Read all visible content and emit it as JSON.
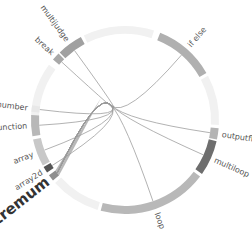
{
  "diagram": {
    "type": "chord",
    "center": [
      125,
      120
    ],
    "inner_radius": 86,
    "outer_radius": 94,
    "highlighted_group": "extremum",
    "groups": [
      {
        "name": "extremum",
        "start": -40,
        "end": -36,
        "color": "#8f8f8f",
        "highlight": true
      },
      {
        "name": "array2d",
        "start": -34,
        "end": -30,
        "color": "#555555"
      },
      {
        "name": "array",
        "start": -29,
        "end": -12,
        "color": "#c8c8c8"
      },
      {
        "name": "function",
        "start": -10,
        "end": 3,
        "color": "#b8b8b8"
      },
      {
        "name": "greatnumber",
        "start": 5,
        "end": 9,
        "color": "#e8e8e8"
      },
      {
        "name": "break",
        "start": 40,
        "end": 45,
        "color": "#a8a8a8"
      },
      {
        "name": "multijudge",
        "start": 46,
        "end": 62,
        "color": "#a0a0a0"
      },
      {
        "name": "if else",
        "start": 112,
        "end": 150,
        "color": "#b0b0b0"
      },
      {
        "name": "outputfloat",
        "start": 185,
        "end": 192,
        "color": "#b4b4b4"
      },
      {
        "name": "multiloop",
        "start": 193,
        "end": 215,
        "color": "#6e6e6e"
      },
      {
        "name": "loop",
        "start": 217,
        "end": 285,
        "color": "#b8b8b8"
      }
    ],
    "faint_arcs": [
      {
        "start": -4,
        "end": 36
      },
      {
        "start": 64,
        "end": 108
      },
      {
        "start": 152,
        "end": 183
      },
      {
        "start": 287,
        "end": 318
      }
    ],
    "chords": [
      {
        "from": "extremum",
        "to": "loop"
      },
      {
        "from": "extremum",
        "to": "multiloop"
      },
      {
        "from": "extremum",
        "to": "outputfloat"
      },
      {
        "from": "extremum",
        "to": "if else"
      },
      {
        "from": "extremum",
        "to": "array"
      },
      {
        "from": "extremum",
        "to": "function"
      },
      {
        "from": "extremum",
        "to": "greatnumber"
      },
      {
        "from": "extremum",
        "to": "break"
      },
      {
        "from": "extremum",
        "to": "multijudge"
      },
      {
        "from": "extremum",
        "to": "array2d"
      }
    ]
  }
}
